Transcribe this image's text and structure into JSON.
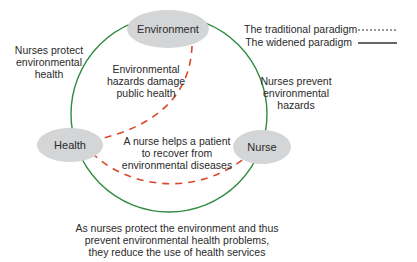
{
  "nodes": {
    "environment": {
      "label": "Environment"
    },
    "health": {
      "label": "Health"
    },
    "nurse": {
      "label": "Nurse"
    }
  },
  "labels": {
    "protect_env_health": [
      "Nurses protect",
      "environmental",
      "health"
    ],
    "hazards_damage": [
      "Environmental",
      "hazards damage",
      "public health"
    ],
    "prevent_hazards": [
      "Nurses prevent",
      "environmental",
      "hazards"
    ],
    "helps_patient": [
      "A nurse helps a patient",
      "to recover from",
      "environmental diseases"
    ],
    "bottom_note": [
      "As nurses protect the environment and thus",
      "prevent environmental health problems,",
      "they reduce the use of health services"
    ]
  },
  "legend": {
    "traditional": "The traditional paradigm",
    "widened": "The widened paradigm"
  },
  "colors": {
    "node_fill": "#d4d5d6",
    "widened_line": "#2e8b3e",
    "traditional_line": "#d9482b",
    "text": "#2a2a2a"
  }
}
